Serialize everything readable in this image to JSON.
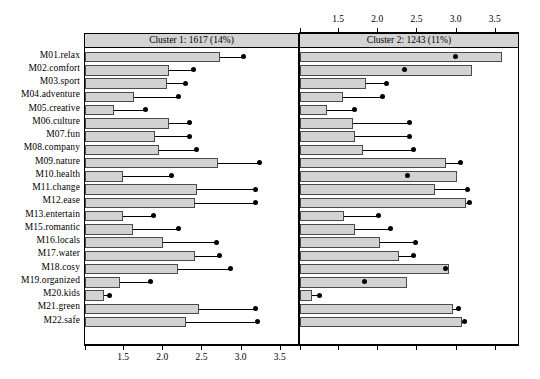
{
  "chart_data": {
    "type": "bar",
    "title": "",
    "xlabel": "",
    "ylabel": "",
    "orientation": "horizontal",
    "grid": false,
    "legend": "none",
    "xlim": [
      1.0,
      3.72
    ],
    "axis_ticks": [
      1.5,
      2.0,
      2.5,
      3.0,
      3.5
    ],
    "tick_labels": [
      "1.5",
      "2.0",
      "2.5",
      "3.0",
      "3.5"
    ],
    "categories": [
      "M01.relax",
      "M02.comfort",
      "M03.sport",
      "M04.adventure",
      "M05.creative",
      "M06.culture",
      "M07.fun",
      "M08.company",
      "M09.nature",
      "M10.health",
      "M11.change",
      "M12.ease",
      "M13.entertain",
      "M15.romantic",
      "M16.locals",
      "M17.water",
      "M18.cosy",
      "M19.organized",
      "M20.kids",
      "M21.green",
      "M22.safe"
    ],
    "panels": [
      {
        "id": "cluster-1",
        "header": "Cluster 1: 1617 (14%)",
        "cluster_name": "Cluster 1",
        "count": 1617,
        "percent": "14%",
        "bar_values": [
          2.72,
          2.07,
          2.05,
          1.62,
          1.37,
          2.07,
          1.9,
          1.95,
          2.7,
          1.48,
          2.43,
          2.41,
          1.48,
          1.61,
          2.0,
          2.4,
          2.19,
          1.45,
          1.24,
          2.45,
          2.29
        ],
        "dot_values": [
          3.02,
          2.38,
          2.28,
          2.2,
          1.77,
          2.33,
          2.33,
          2.42,
          3.23,
          2.1,
          3.18,
          3.18,
          1.87,
          2.2,
          2.68,
          2.72,
          2.86,
          1.84,
          1.31,
          3.18,
          3.2
        ]
      },
      {
        "id": "cluster-2",
        "header": "Cluster 2: 1243 (11%)",
        "cluster_name": "Cluster 2",
        "count": 1243,
        "percent": "11%",
        "bar_values": [
          3.58,
          3.2,
          1.84,
          1.55,
          1.34,
          1.68,
          1.7,
          1.8,
          2.87,
          3.0,
          2.73,
          3.12,
          1.56,
          1.7,
          2.02,
          2.27,
          2.9,
          2.36,
          1.15,
          2.95,
          3.07
        ],
        "dot_values": [
          2.98,
          2.33,
          2.1,
          2.05,
          1.7,
          2.4,
          2.4,
          2.45,
          3.05,
          2.37,
          3.14,
          3.17,
          2.0,
          2.15,
          2.48,
          2.45,
          2.86,
          1.83,
          1.25,
          3.02,
          3.1
        ]
      }
    ]
  },
  "colors": {
    "bar_fill": "#d2d2d2",
    "bar_stroke": "#4a4a4a",
    "header_fill": "#d4d4d4",
    "marker": "#000000",
    "background": "#ffffff"
  }
}
